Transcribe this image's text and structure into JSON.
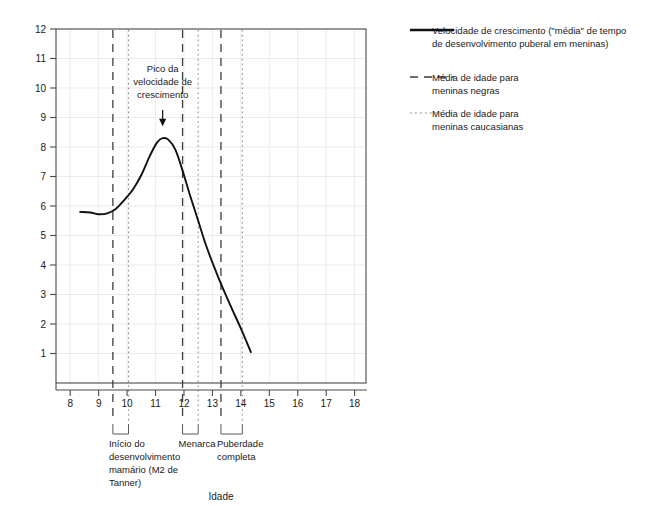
{
  "chart_data": {
    "type": "line",
    "title": "",
    "xlabel": "Idade",
    "ylabel": "",
    "xlim": [
      7.5,
      18.4
    ],
    "ylim": [
      0,
      12
    ],
    "grid": true,
    "x_ticks": [
      8,
      9,
      10,
      11,
      12,
      13,
      14,
      15,
      16,
      17,
      18
    ],
    "x_tick_labels": [
      "8",
      "9",
      "10",
      "11",
      "12",
      "13",
      "14",
      "15",
      "16",
      "17",
      "18"
    ],
    "y_ticks": [
      1,
      2,
      3,
      4,
      5,
      6,
      7,
      8,
      9,
      10,
      11,
      12
    ],
    "y_tick_labels": [
      "1",
      "2",
      "3",
      "4",
      "5",
      "6",
      "7",
      "8",
      "9",
      "10",
      "11",
      "12"
    ],
    "series": [
      {
        "name": "Velocidade de crescimento",
        "style": "solid",
        "x": [
          8.35,
          8.7,
          9.0,
          9.3,
          9.6,
          9.9,
          10.2,
          10.5,
          10.8,
          11.05,
          11.25,
          11.45,
          11.7,
          11.95,
          12.2,
          12.5,
          12.8,
          13.2,
          13.6,
          14.0,
          14.35
        ],
        "y": [
          5.8,
          5.78,
          5.72,
          5.75,
          5.9,
          6.2,
          6.55,
          7.05,
          7.7,
          8.15,
          8.3,
          8.25,
          7.9,
          7.2,
          6.4,
          5.5,
          4.6,
          3.6,
          2.7,
          1.85,
          1.05
        ]
      }
    ],
    "vertical_markers": [
      {
        "label": "inicio-negras",
        "x": 9.5,
        "style": "dashed"
      },
      {
        "label": "inicio-caucasianas",
        "x": 10.05,
        "style": "dotted"
      },
      {
        "label": "menarca-negras",
        "x": 11.95,
        "style": "dashed"
      },
      {
        "label": "menarca-caucasianas",
        "x": 12.5,
        "style": "dotted"
      },
      {
        "label": "puberdade-negras",
        "x": 13.3,
        "style": "dashed"
      },
      {
        "label": "puberdade-caucasianas",
        "x": 14.05,
        "style": "dotted"
      }
    ],
    "annotations": [
      {
        "name": "peak-annotation",
        "lines": [
          "Pico da",
          "velocidade de",
          "crescimento"
        ],
        "x": 11.25,
        "y": 8.35
      }
    ],
    "stage_brackets": [
      {
        "name": "inicio-desenvolvimento-mamario",
        "from_x": 9.5,
        "to_x": 10.05,
        "lines": [
          "Início do",
          "desenvolvimento",
          "mamário (M2 de",
          "Tanner)"
        ]
      },
      {
        "name": "menarca",
        "from_x": 11.95,
        "to_x": 12.5,
        "lines": [
          "Menarca"
        ]
      },
      {
        "name": "puberdade-completa",
        "from_x": 13.3,
        "to_x": 14.05,
        "lines": [
          "Puberdade",
          "completa"
        ]
      }
    ],
    "legend": {
      "position": "right",
      "entries": [
        {
          "name": "legend-growth-velocity",
          "style": "solid",
          "color": "#111111",
          "lines": [
            "Velocidade de crescimento (\"média\" de tempo",
            "de desenvolvimento puberal em meninas)"
          ]
        },
        {
          "name": "legend-black-girls",
          "style": "dashed",
          "color": "#3d3d3d",
          "lines": [
            "Média de idade para",
            "meninas negras"
          ]
        },
        {
          "name": "legend-caucasian-girls",
          "style": "dotted",
          "color": "#8d8d8d",
          "lines": [
            "Média de idade para",
            "meninas caucasianas"
          ]
        }
      ]
    }
  }
}
